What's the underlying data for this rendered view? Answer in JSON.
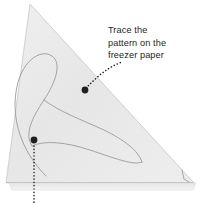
{
  "illustration": {
    "title": "Trace the pattern on the freezer paper",
    "subject": "folded freezer paper triangle with traced leaf pattern"
  },
  "annotation": {
    "line1": "Trace the",
    "line2": "pattern on the",
    "line3": "freezer paper"
  },
  "callouts": [
    {
      "name": "freezer-paper-callout",
      "dot_x": 85,
      "dot_y": 90,
      "label": "Trace the pattern on the freezer paper"
    },
    {
      "name": "lower-edge-callout",
      "dot_x": 34,
      "dot_y": 140,
      "label": ""
    }
  ],
  "colors": {
    "paper_fill": "#ececec",
    "paper_fill_light": "#f4f4f4",
    "paper_edge": "#c8c8c8",
    "pattern_stroke": "#9a9a9a",
    "leader_dot": "#231f20",
    "text": "#231f20",
    "background": "#ffffff"
  },
  "geometry": {
    "triangle_apex": [
      30,
      4
    ],
    "triangle_bottom_left": [
      6,
      183
    ],
    "triangle_bottom_right": [
      194,
      183
    ],
    "bottom_strip_height": 7
  }
}
